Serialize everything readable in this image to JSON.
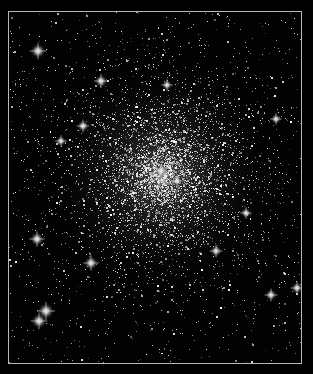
{
  "image": {
    "subject": "globular star cluster",
    "background_color": "#000000",
    "border_color": "#b8b8b8",
    "frame": {
      "x": 8,
      "y": 11,
      "width": 294,
      "height": 353
    }
  },
  "render": {
    "seed": 1337,
    "cluster_center": {
      "x": 160,
      "y": 175
    },
    "core_radius": 55,
    "faint_star_count": 5200,
    "background_star_count": 900,
    "bright_stars": [
      {
        "x": 37,
        "y": 50,
        "r": 2.6
      },
      {
        "x": 100,
        "y": 80,
        "r": 2.2
      },
      {
        "x": 166,
        "y": 84,
        "r": 1.8
      },
      {
        "x": 82,
        "y": 125,
        "r": 2.0
      },
      {
        "x": 275,
        "y": 118,
        "r": 1.8
      },
      {
        "x": 60,
        "y": 140,
        "r": 1.8
      },
      {
        "x": 160,
        "y": 170,
        "r": 2.0
      },
      {
        "x": 176,
        "y": 180,
        "r": 1.8
      },
      {
        "x": 36,
        "y": 238,
        "r": 2.4
      },
      {
        "x": 90,
        "y": 262,
        "r": 2.4
      },
      {
        "x": 215,
        "y": 250,
        "r": 2.0
      },
      {
        "x": 270,
        "y": 294,
        "r": 2.0
      },
      {
        "x": 45,
        "y": 310,
        "r": 2.8
      },
      {
        "x": 38,
        "y": 320,
        "r": 2.6
      },
      {
        "x": 245,
        "y": 212,
        "r": 1.8
      },
      {
        "x": 296,
        "y": 287,
        "r": 2.0
      }
    ]
  }
}
